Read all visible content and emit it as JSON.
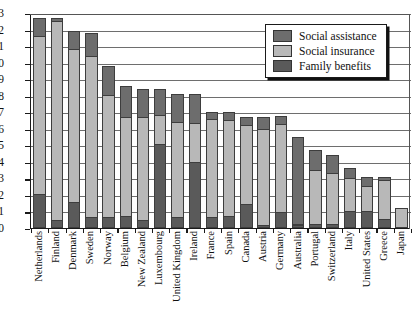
{
  "chart_data": {
    "type": "bar",
    "subtype": "stacked-bar",
    "title": "",
    "xlabel": "",
    "ylabel": "",
    "ylim": [
      0,
      13
    ],
    "ytick_step": 1,
    "yticks": [
      "13",
      "12",
      "11",
      "10",
      "9",
      "8",
      "7",
      "6",
      "5",
      "4",
      "3",
      "2",
      "1",
      "0"
    ],
    "grid": true,
    "grid_axis": "y",
    "legend_position": "top-right",
    "categories": [
      "Netherlands",
      "Finland",
      "Denmark",
      "Sweden",
      "Norway",
      "Belgium",
      "New Zealand",
      "Luxembourg",
      "United Kingdom",
      "Ireland",
      "France",
      "Spain",
      "Canada",
      "Austria",
      "Germany",
      "Australia",
      "Portugal",
      "Switzerland",
      "Italy",
      "United States",
      "Greece",
      "Japan"
    ],
    "series": [
      {
        "name": "Family benefits",
        "color": "#5a5a5a",
        "stack_order": 0,
        "values": [
          2.0,
          0.4,
          1.5,
          0.6,
          0.6,
          0.7,
          0.4,
          5.1,
          0.6,
          4.0,
          0.6,
          0.7,
          1.4,
          0.1,
          0.9,
          0.1,
          0.2,
          0.2,
          1.0,
          1.0,
          0.5,
          0.0
        ]
      },
      {
        "name": "Social insurance",
        "color": "#b8b8b8",
        "stack_order": 1,
        "values": [
          9.6,
          12.1,
          9.3,
          9.8,
          7.4,
          6.0,
          6.3,
          1.7,
          5.8,
          2.3,
          6.0,
          5.8,
          4.8,
          5.9,
          5.4,
          0.0,
          3.3,
          3.1,
          2.0,
          1.5,
          2.4,
          1.2
        ]
      },
      {
        "name": "Social assistance",
        "color": "#6d6d6d",
        "stack_order": 2,
        "values": [
          1.1,
          0.2,
          1.1,
          1.4,
          1.8,
          1.9,
          1.7,
          1.6,
          1.7,
          1.8,
          0.4,
          0.5,
          0.5,
          0.7,
          0.5,
          5.4,
          1.2,
          1.1,
          0.6,
          0.6,
          0.2,
          0.0
        ]
      }
    ],
    "totals": [
      12.7,
      12.7,
      11.9,
      11.8,
      9.8,
      8.6,
      8.4,
      8.4,
      8.1,
      8.1,
      7.0,
      7.0,
      6.7,
      6.7,
      6.8,
      5.5,
      4.7,
      4.4,
      3.6,
      3.1,
      3.1,
      1.2
    ]
  },
  "legend": {
    "items": [
      {
        "label": "Social assistance",
        "color": "#6d6d6d"
      },
      {
        "label": "Social insurance",
        "color": "#b8b8b8"
      },
      {
        "label": "Family benefits",
        "color": "#5a5a5a"
      }
    ]
  }
}
